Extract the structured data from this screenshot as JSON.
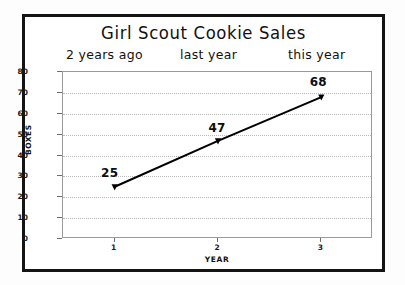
{
  "chart_data": {
    "type": "line",
    "title": "Girl Scout Cookie Sales",
    "xlabel": "YEAR",
    "ylabel": "BOXES",
    "categories": [
      "1",
      "2",
      "3"
    ],
    "x": [
      1,
      2,
      3
    ],
    "values": [
      25,
      47,
      68
    ],
    "point_labels": [
      "25",
      "47",
      "68"
    ],
    "annotations": [
      "2 years ago",
      "last year",
      "this year"
    ],
    "ylim": [
      0,
      80
    ],
    "xlim": [
      0.5,
      3.5
    ],
    "ytick_labels": [
      "0",
      "10",
      "20",
      "30",
      "40",
      "50",
      "60",
      "70",
      "80"
    ],
    "ytick_values": [
      0,
      10,
      20,
      30,
      40,
      50,
      60,
      70,
      80
    ],
    "xtick_labels": [
      "1",
      "2",
      "3"
    ],
    "grid": "horizontal-dotted",
    "legend": "none",
    "series": [
      {
        "name": "Boxes sold",
        "values": [
          25,
          47,
          68
        ],
        "color": "#000000",
        "marker": "triangle",
        "line_style": "solid"
      }
    ]
  },
  "colors": {
    "frame": "#141414",
    "plot_border": "#9a9a9a",
    "gridline": "#b9b9b9",
    "line": "#000000",
    "text": "#111111",
    "background": "#ffffff"
  }
}
